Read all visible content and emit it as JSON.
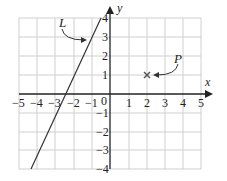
{
  "diagram": {
    "x_axis_label": "x",
    "y_axis_label": "y",
    "x_ticks": [
      "−5",
      "−4",
      "−3",
      "−2",
      "−1",
      "0",
      "1",
      "2",
      "3",
      "4",
      "5"
    ],
    "y_ticks": [
      "4",
      "3",
      "2",
      "1",
      "−1",
      "−2",
      "−3",
      "−4"
    ],
    "line_label": "L",
    "point_label": "P",
    "point": [
      2,
      1
    ],
    "line_equation": "y = 2x + 5",
    "xlim": [
      -5,
      5
    ],
    "ylim": [
      -4,
      4
    ]
  }
}
